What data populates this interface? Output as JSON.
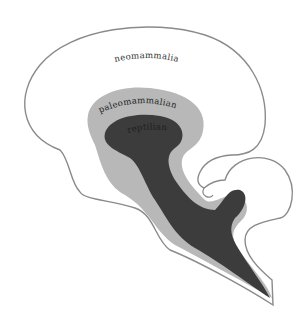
{
  "diagram": {
    "regions": [
      {
        "id": "neomammalian",
        "label": "neomammalian",
        "fill": "#ffffff",
        "stroke": "#8a8a8a"
      },
      {
        "id": "paleomammalian",
        "label": "paleomammalian",
        "fill": "#b8b8b8"
      },
      {
        "id": "reptilian",
        "label": "reptilian",
        "fill": "#3c3c3c",
        "label_color": "#222222"
      }
    ]
  }
}
